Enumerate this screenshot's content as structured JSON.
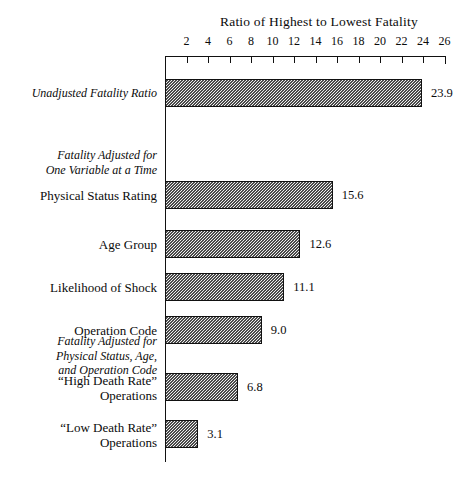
{
  "chart_data": {
    "type": "bar",
    "orientation": "horizontal",
    "title": "Ratio of Highest to Lowest Fatality",
    "xlabel": "",
    "ylabel": "",
    "xlim": [
      0,
      26
    ],
    "xticks": [
      2,
      4,
      6,
      8,
      10,
      12,
      14,
      16,
      18,
      20,
      22,
      24,
      26
    ],
    "grid": false,
    "legend": null,
    "categories": [
      "Unadjusted Fatality Ratio",
      "Physical Status Rating",
      "Age Group",
      "Likelihood of Shock",
      "Operation Code",
      "“High Death Rate”\nOperations",
      "“Low Death Rate”\nOperations"
    ],
    "values": [
      23.9,
      15.6,
      12.6,
      11.1,
      9.0,
      6.8,
      3.1
    ],
    "value_labels": [
      "23.9",
      "15.6",
      "12.6",
      "11.1",
      "9.0",
      "6.8",
      "3.1"
    ],
    "section_headers": [
      "Fatality Adjusted for\nOne Variable at a Time",
      "Fatality Adjusted for\nPhysical Status, Age,\nand Operation Code"
    ],
    "bar_fill": "#f2f2f2",
    "bar_edge": "#111111",
    "axis_color": "#111111",
    "background": "#ffffff"
  },
  "bars": [
    {
      "label": "Unadjusted Fatality Ratio",
      "value": 23.9,
      "value_label": "23.9",
      "italic": true,
      "top": 79,
      "label_top": 86,
      "label_lines": 1
    },
    {
      "label": "Physical Status Rating",
      "value": 15.6,
      "value_label": "15.6",
      "italic": false,
      "top": 181,
      "label_top": 188,
      "label_lines": 1
    },
    {
      "label": "Age Group",
      "value": 12.6,
      "value_label": "12.6",
      "italic": false,
      "top": 230,
      "label_top": 237,
      "label_lines": 1
    },
    {
      "label": "Likelihood of Shock",
      "value": 11.1,
      "value_label": "11.1",
      "italic": false,
      "top": 273,
      "label_top": 280,
      "label_lines": 1
    },
    {
      "label": "Operation Code",
      "value": 9.0,
      "value_label": "9.0",
      "italic": false,
      "top": 316,
      "label_top": 323,
      "label_lines": 1
    },
    {
      "label": "“High Death Rate”\nOperations",
      "value": 6.8,
      "value_label": "6.8",
      "italic": false,
      "top": 373,
      "label_top": 373,
      "label_lines": 2
    },
    {
      "label": "“Low Death Rate”\nOperations",
      "value": 3.1,
      "value_label": "3.1",
      "italic": false,
      "top": 420,
      "label_top": 420,
      "label_lines": 2
    }
  ],
  "sections": [
    {
      "text": "Fatality Adjusted for\nOne Variable at a Time",
      "top": 148
    },
    {
      "text": "Fatality Adjusted for\nPhysical Status, Age,\nand Operation Code",
      "top": 334
    }
  ],
  "axis": {
    "ticks": [
      "2",
      "4",
      "6",
      "8",
      "10",
      "12",
      "14",
      "16",
      "18",
      "20",
      "22",
      "24",
      "26"
    ]
  }
}
